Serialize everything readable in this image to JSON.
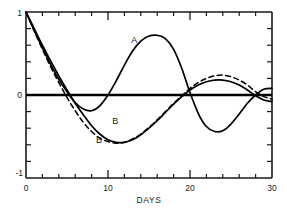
{
  "chart_data": {
    "type": "line",
    "title": "",
    "subtitle": "",
    "xlabel": "DAYS",
    "ylabel": "",
    "xlim": [
      0,
      30
    ],
    "ylim": [
      -1,
      1
    ],
    "grid": false,
    "legend_position": "inline-annotations",
    "x_ticks_major": [
      0,
      10,
      20,
      30
    ],
    "x_tick_labels": [
      "0",
      "10",
      "20",
      "30"
    ],
    "x_ticks_minor": [
      2,
      4,
      6,
      8,
      12,
      14,
      16,
      18,
      22,
      24,
      26,
      28
    ],
    "y_ticks_major": [
      -1,
      0,
      1
    ],
    "y_tick_labels_top": "1",
    "y_tick_labels_mid": "0",
    "y_tick_labels_bottom": "-1",
    "y_ticks_minor": [
      -0.8,
      -0.6,
      -0.4,
      -0.2,
      0.2,
      0.4,
      0.6,
      0.8
    ],
    "zero_line": 0,
    "annotations": [
      {
        "text": "A",
        "x": 13.2,
        "y": 0.63,
        "refers_to": "curve-a"
      },
      {
        "text": "B",
        "x": 10.9,
        "y": -0.35,
        "refers_to": "curve-b-solid"
      },
      {
        "text": "B",
        "x": 8.9,
        "y": -0.58,
        "refers_to": "curve-b-dashed"
      }
    ],
    "series": [
      {
        "name": "A",
        "style": "solid",
        "color": "#000000",
        "x": [
          0,
          1,
          2,
          3,
          4,
          5,
          6,
          7,
          8,
          9,
          10,
          11,
          12,
          13,
          14,
          15,
          16,
          17,
          18,
          19,
          20,
          21,
          22,
          23,
          24,
          25,
          26,
          27,
          28,
          29,
          30
        ],
        "y": [
          1.0,
          0.78,
          0.57,
          0.37,
          0.19,
          0.04,
          -0.09,
          -0.17,
          -0.19,
          -0.13,
          0.0,
          0.17,
          0.36,
          0.53,
          0.65,
          0.71,
          0.72,
          0.68,
          0.55,
          0.32,
          0.03,
          -0.22,
          -0.38,
          -0.44,
          -0.43,
          -0.35,
          -0.23,
          -0.1,
          0.0,
          0.07,
          0.08
        ]
      },
      {
        "name": "B",
        "style": "solid",
        "color": "#000000",
        "x": [
          0,
          1,
          2,
          3,
          4,
          5,
          6,
          7,
          8,
          9,
          10,
          11,
          12,
          13,
          14,
          15,
          16,
          17,
          18,
          19,
          20,
          21,
          22,
          23,
          24,
          25,
          26,
          27,
          28,
          29,
          30
        ],
        "y": [
          1.0,
          0.8,
          0.6,
          0.41,
          0.23,
          0.06,
          -0.1,
          -0.24,
          -0.37,
          -0.47,
          -0.54,
          -0.57,
          -0.57,
          -0.54,
          -0.48,
          -0.4,
          -0.31,
          -0.21,
          -0.11,
          -0.02,
          0.06,
          0.12,
          0.16,
          0.18,
          0.18,
          0.16,
          0.12,
          0.06,
          -0.01,
          -0.06,
          -0.08
        ]
      },
      {
        "name": "B",
        "style": "dashed",
        "color": "#000000",
        "x": [
          0,
          1,
          2,
          3,
          4,
          5,
          6,
          7,
          8,
          9,
          10,
          11,
          12,
          13,
          14,
          15,
          16,
          17,
          18,
          19,
          20,
          21,
          22,
          23,
          24,
          25,
          26,
          27,
          28,
          29,
          30
        ],
        "y": [
          1.0,
          0.77,
          0.55,
          0.34,
          0.15,
          -0.03,
          -0.19,
          -0.33,
          -0.44,
          -0.52,
          -0.56,
          -0.58,
          -0.57,
          -0.53,
          -0.47,
          -0.39,
          -0.3,
          -0.2,
          -0.1,
          -0.01,
          0.08,
          0.15,
          0.2,
          0.23,
          0.24,
          0.22,
          0.18,
          0.12,
          0.04,
          -0.02,
          -0.05
        ]
      }
    ]
  },
  "axes": {
    "x_title": "DAYS",
    "y_top_label": "1",
    "y_zero_label": "0",
    "y_bottom_label": "-1",
    "x_labels": [
      "0",
      "10",
      "20",
      "30"
    ]
  },
  "labels": {
    "curve_a": "A",
    "curve_b_solid": "B",
    "curve_b_dashed": "B"
  },
  "colors": {
    "line": "#000000",
    "axis": "#1a1a1a",
    "background": "#ffffff"
  }
}
